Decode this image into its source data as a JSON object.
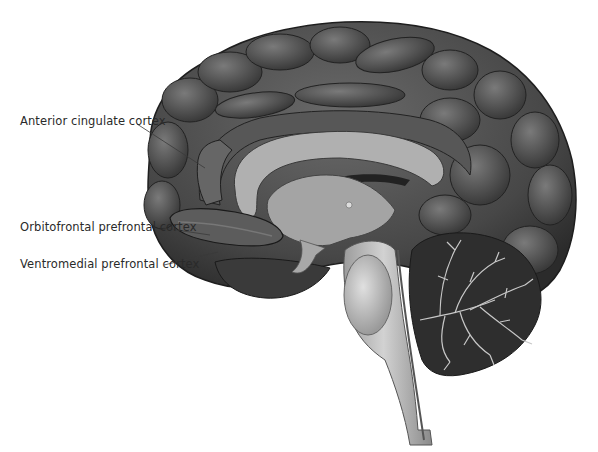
{
  "figure": {
    "labels": [
      {
        "id": "acc",
        "text": "Anterior cingulate cortex",
        "x": 20,
        "y": 121,
        "leader_to": [
          205,
          180
        ]
      },
      {
        "id": "ofc",
        "text": "Orbitofrontal prefrontal cortex",
        "x": 20,
        "y": 227,
        "leader_to": [
          210,
          233
        ]
      },
      {
        "id": "vmpfc",
        "text": "Ventromedial prefrontal cortex",
        "x": 20,
        "y": 264,
        "leader_to": [
          218,
          253
        ]
      }
    ],
    "colors": {
      "cortex": "#4a4a4a",
      "cortex_highlight": "#6e6e6e",
      "cortex_dark": "#2a2a2a",
      "white_matter": "#9a9a9a",
      "corpus_callosum": "#a8a8a8",
      "brainstem": "#b8b8b8",
      "cerebellum": "#2e2e2e",
      "arbor_vitae": "#c9c9c9",
      "leader_line": "#3a3a3a",
      "label_text": "#2a2a2a"
    }
  }
}
